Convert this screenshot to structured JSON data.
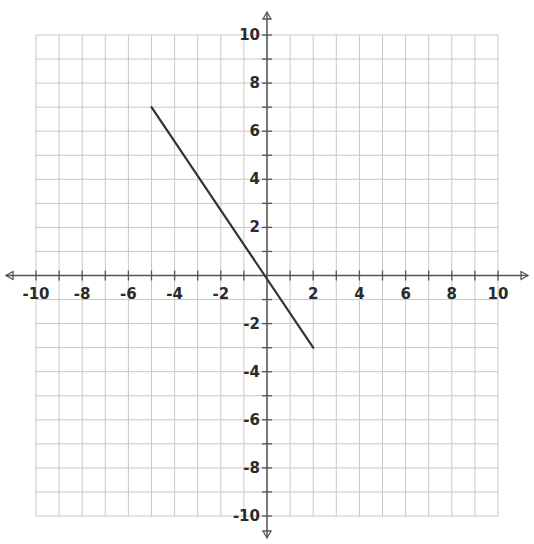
{
  "chart_data": {
    "type": "line",
    "title": "",
    "xlabel": "",
    "ylabel": "",
    "xlim": [
      -10,
      10
    ],
    "ylim": [
      -10,
      10
    ],
    "grid": true,
    "grid_step": 1,
    "x_ticks": [
      -10,
      -8,
      -6,
      -4,
      -2,
      2,
      4,
      6,
      8,
      10
    ],
    "y_ticks": [
      10,
      8,
      6,
      4,
      2,
      -2,
      -4,
      -6,
      -8,
      -10
    ],
    "x_tick_labels": [
      "-10",
      "-8",
      "-6",
      "-4",
      "-2",
      "2",
      "4",
      "6",
      "8",
      "10"
    ],
    "y_tick_labels": [
      "10",
      "8",
      "6",
      "4",
      "2",
      "-2",
      "-4",
      "-6",
      "-8",
      "-10"
    ],
    "series": [
      {
        "name": "line segment",
        "points": [
          [
            -5,
            7
          ],
          [
            2,
            -3
          ]
        ],
        "color": "#333333"
      }
    ],
    "legend": null
  },
  "colors": {
    "grid": "#c8c8c8",
    "axis": "#555555",
    "line": "#333333",
    "text": "#2a2a2a"
  }
}
